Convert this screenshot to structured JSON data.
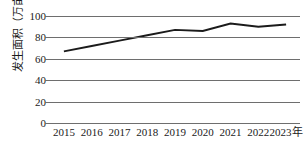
{
  "chart_data": {
    "type": "line",
    "title": "",
    "subtitle": "",
    "xlabel": "年",
    "ylabel": "发生面积（万亩）",
    "categories": [
      "2015",
      "2016",
      "2017",
      "2018",
      "2019",
      "2020",
      "2021",
      "2022",
      "2023"
    ],
    "x": [
      2015,
      2016,
      2017,
      2018,
      2019,
      2020,
      2021,
      2022,
      2023
    ],
    "values": [
      67,
      72,
      77,
      82,
      87,
      86,
      93,
      90,
      92
    ],
    "series": [
      {
        "name": "发生面积",
        "values": [
          67,
          72,
          77,
          82,
          87,
          86,
          93,
          90,
          92
        ]
      }
    ],
    "ylim": [
      0,
      100
    ],
    "yticks": [
      0,
      20,
      40,
      60,
      80,
      100
    ],
    "ytick_labels": [
      "0",
      "20",
      "40",
      "60",
      "80",
      "100"
    ],
    "xtick_labels": [
      "2015",
      "2016",
      "2017",
      "2018",
      "2019",
      "2020",
      "2021",
      "2022",
      "2023年"
    ],
    "grid": true,
    "grid_axis": "y",
    "legend": false,
    "legend_position": "none",
    "markers": false,
    "line_color": "#1b1b1b",
    "grid_color": "#6e6e6e",
    "background_color": "#ffffff",
    "axis_unit_suffix": "年"
  }
}
